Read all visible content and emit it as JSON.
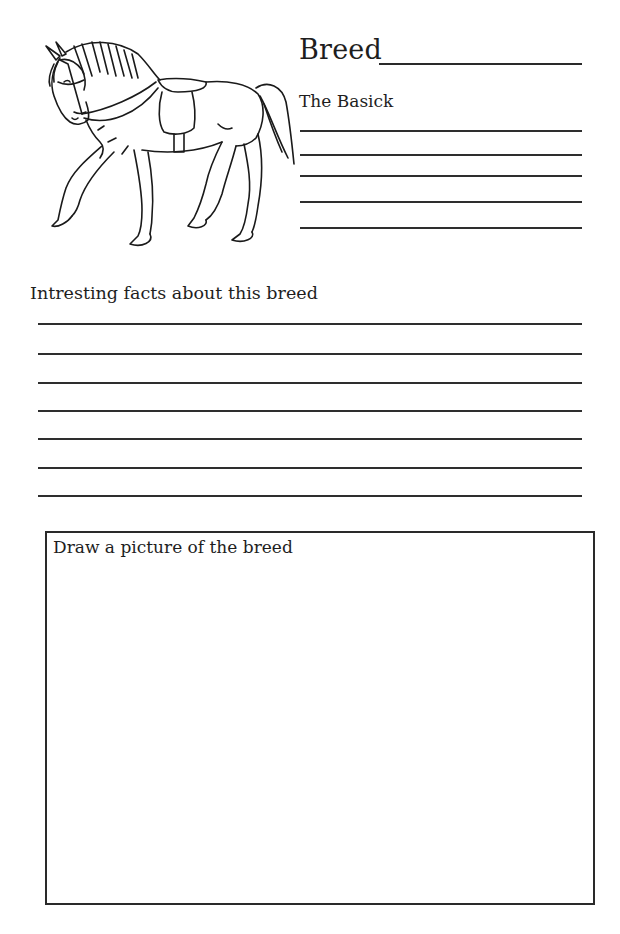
{
  "header": {
    "title": "Breed",
    "subtitle": "The Basick"
  },
  "illustration": {
    "icon": "horse-with-saddle-line-art"
  },
  "basics_lines": [
    {
      "y": 130
    },
    {
      "y": 154
    },
    {
      "y": 175
    },
    {
      "y": 201
    },
    {
      "y": 227
    }
  ],
  "facts": {
    "label": "Intresting facts about this breed",
    "lines": [
      {
        "y": 323
      },
      {
        "y": 353
      },
      {
        "y": 382
      },
      {
        "y": 410
      },
      {
        "y": 438
      },
      {
        "y": 467
      },
      {
        "y": 495
      }
    ]
  },
  "drawing": {
    "label": "Draw a picture of the breed"
  },
  "colors": {
    "ink": "#1e1e1e",
    "paper": "#ffffff"
  }
}
